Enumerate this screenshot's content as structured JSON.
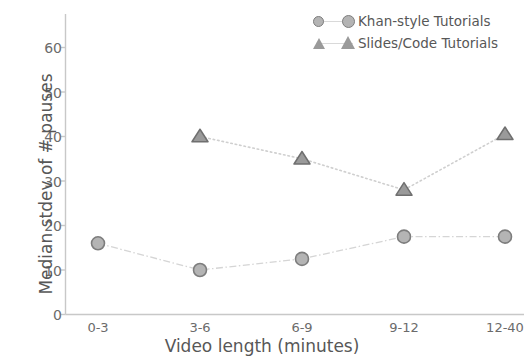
{
  "chart_data": {
    "type": "line",
    "title": "",
    "xlabel": "Video length (minutes)",
    "ylabel": "Median stdev of # pauses",
    "categories": [
      "0-3",
      "3-6",
      "6-9",
      "9-12",
      "12-40"
    ],
    "yticks": [
      0,
      10,
      20,
      30,
      40,
      50,
      60
    ],
    "ylim": [
      0,
      68
    ],
    "grid": false,
    "legend_position": "top-right",
    "series": [
      {
        "name": "Khan-style Tutorials",
        "marker": "circle",
        "linestyle": "dashdot",
        "color": "#b4b4b4",
        "edge_color": "#7d7d7d",
        "values": [
          16,
          10,
          12.5,
          17.5,
          17.5
        ]
      },
      {
        "name": "Slides/Code Tutorials",
        "marker": "triangle",
        "linestyle": "dotted",
        "color": "#9a9a9a",
        "edge_color": "#6f6f6f",
        "values": [
          null,
          40,
          35,
          28,
          40.5
        ]
      }
    ]
  },
  "axes": {
    "ylabel": "Median stdev of # pauses",
    "xlabel": "Video length (minutes)",
    "ytick_labels": [
      "60",
      "50",
      "40",
      "30",
      "20",
      "10",
      "0"
    ],
    "xtick_labels": [
      "0-3",
      "3-6",
      "6-9",
      "9-12",
      "12-40"
    ]
  },
  "legend": {
    "entries": [
      {
        "label": "Khan-style Tutorials",
        "marker": "circle-marker"
      },
      {
        "label": "Slides/Code Tutorials",
        "marker": "triangle-marker"
      }
    ]
  }
}
